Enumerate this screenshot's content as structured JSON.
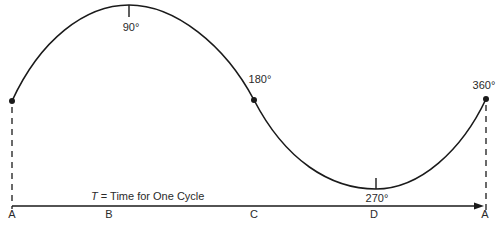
{
  "diagram": {
    "colors": {
      "stroke": "#1a1a1a",
      "text": "#2a2a2a",
      "background": "#ffffff"
    },
    "angle_labels": {
      "deg90": "90°",
      "deg180": "180°",
      "deg270": "270°",
      "deg360": "360°"
    },
    "axis": {
      "caption_var": "T",
      "caption_rest": " = Time for One Cycle",
      "point_labels": [
        "A",
        "B",
        "C",
        "D",
        "A"
      ]
    },
    "points": [
      {
        "name": "A",
        "angle": 0,
        "x": 12,
        "y": 101
      },
      {
        "name": "B",
        "angle": 90,
        "x": 129,
        "y": 5
      },
      {
        "name": "C",
        "angle": 180,
        "x": 254,
        "y": 100
      },
      {
        "name": "D",
        "angle": 270,
        "x": 376,
        "y": 189
      },
      {
        "name": "A",
        "angle": 360,
        "x": 486,
        "y": 99
      }
    ]
  }
}
